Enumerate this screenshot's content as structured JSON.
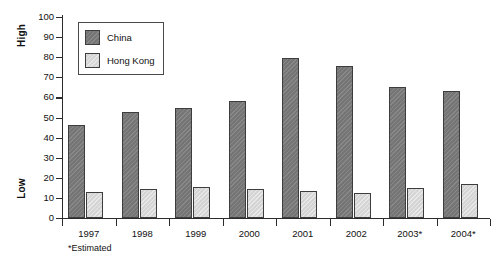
{
  "chart_data": {
    "type": "bar",
    "title": "",
    "subtitle": "",
    "xlabel": "",
    "ylabel": "",
    "axis_side_labels": {
      "top": "High",
      "bottom": "Low"
    },
    "categories": [
      "1997",
      "1998",
      "1999",
      "2000",
      "2001",
      "2002",
      "2003*",
      "2004*"
    ],
    "series": [
      {
        "name": "China",
        "color": "#7b7b7b",
        "values": [
          46.5,
          52.5,
          54.5,
          58,
          79.5,
          75.5,
          65,
          63
        ]
      },
      {
        "name": "Hong Kong",
        "color": "#dcdcdc",
        "values": [
          13,
          14.5,
          15.5,
          14.5,
          13.5,
          12.5,
          15,
          17
        ]
      }
    ],
    "ylim": [
      0,
      100
    ],
    "ytick_values": [
      0,
      10,
      20,
      30,
      40,
      50,
      60,
      70,
      80,
      90,
      100
    ],
    "ytick_labels": [
      "0",
      "10",
      "20",
      "30",
      "40",
      "50",
      "60",
      "70",
      "80",
      "90",
      "100"
    ],
    "grid": false,
    "legend_position": "upper-left-inside",
    "legend_entries": [
      "China",
      "Hong Kong"
    ],
    "annotations": [
      "*Estimated"
    ]
  },
  "footnote": {
    "text": "*Estimated"
  },
  "legend": {
    "items": [
      {
        "label": "China",
        "swatch": "legend-swatch-china-icon"
      },
      {
        "label": "Hong Kong",
        "swatch": "legend-swatch-hongkong-icon"
      }
    ]
  },
  "colors": {
    "china": "#7b7b7b",
    "hong_kong": "#dcdcdc",
    "axis": "#2b2b2b",
    "text": "#111111",
    "background": "#ffffff"
  }
}
